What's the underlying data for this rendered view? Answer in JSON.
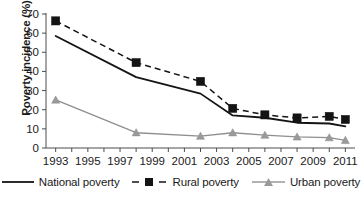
{
  "chart_data": {
    "type": "line",
    "title": "",
    "xlabel": "",
    "ylabel": "Poverty incidence (%)",
    "ylim": [
      0,
      70
    ],
    "xlim": [
      1992.4,
      2011.6
    ],
    "ytick_step": 10,
    "yticks": [
      "0",
      "10",
      "20",
      "30",
      "40",
      "50",
      "60",
      "70"
    ],
    "xticks": [
      "1993",
      "1995",
      "1997",
      "1999",
      "2001",
      "2003",
      "2005",
      "2007",
      "2009",
      "2011"
    ],
    "xtick_values": [
      1993,
      1995,
      1997,
      1999,
      2001,
      2003,
      2005,
      2007,
      2009,
      2011
    ],
    "minor_xticks_every": 1,
    "grid": false,
    "legend_position": "bottom",
    "x": [
      1993,
      1998,
      2002,
      2004,
      2006,
      2008,
      2010,
      2011
    ],
    "series": [
      {
        "name": "National poverty",
        "marker": "none",
        "linestyle": "solid",
        "color": "#141414",
        "values": [
          58.5,
          37.0,
          28.4,
          17.0,
          15.8,
          13.2,
          12.8,
          11.3
        ]
      },
      {
        "name": "Rural poverty",
        "marker": "square",
        "linestyle": "dashed",
        "color": "#141414",
        "values": [
          66.4,
          44.6,
          34.8,
          20.7,
          17.3,
          15.7,
          16.5,
          14.9
        ]
      },
      {
        "name": "Urban poverty",
        "marker": "triangle",
        "linestyle": "solid",
        "color": "#9a9a9a",
        "values": [
          25.1,
          8.0,
          6.2,
          8.0,
          6.7,
          5.8,
          5.4,
          4.0
        ]
      }
    ]
  },
  "legend": {
    "items": [
      {
        "label": "National poverty",
        "icon": "solid-line-swatch"
      },
      {
        "label": "Rural poverty",
        "icon": "dashed-square-swatch"
      },
      {
        "label": "Urban poverty",
        "icon": "gray-triangle-line-swatch"
      }
    ]
  },
  "axis": {
    "y_title": "Poverty incidence (%)"
  },
  "colors": {
    "national": "#141414",
    "rural": "#141414",
    "urban": "#9a9a9a",
    "axis": "#4d4d4d",
    "background": "#ffffff"
  }
}
